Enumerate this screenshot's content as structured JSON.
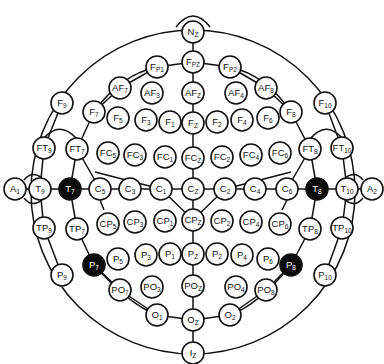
{
  "diagram": {
    "colors": {
      "line": "#111111",
      "fill": "#ffffff",
      "highlight": "#0a0a0a",
      "highlight_text": "#ffffff"
    },
    "radius": 11,
    "electrodes": [
      {
        "id": "Nz",
        "base": "N",
        "sub": "Z",
        "x": 193,
        "y": 32
      },
      {
        "id": "Fpz",
        "base": "F",
        "sub": "PZ",
        "x": 193,
        "y": 62
      },
      {
        "id": "Fp1",
        "base": "F",
        "sub": "P1",
        "x": 157,
        "y": 67
      },
      {
        "id": "Fp2",
        "base": "F",
        "sub": "P2",
        "x": 230,
        "y": 67
      },
      {
        "id": "AF7",
        "base": "AF",
        "sub": "7",
        "x": 120,
        "y": 88
      },
      {
        "id": "AF3",
        "base": "AF",
        "sub": "3",
        "x": 152,
        "y": 93
      },
      {
        "id": "AFz",
        "base": "AF",
        "sub": "Z",
        "x": 193,
        "y": 93
      },
      {
        "id": "AF4",
        "base": "AF",
        "sub": "4",
        "x": 236,
        "y": 93
      },
      {
        "id": "AF8",
        "base": "AF",
        "sub": "8",
        "x": 266,
        "y": 88
      },
      {
        "id": "F9",
        "base": "F",
        "sub": "9",
        "x": 62,
        "y": 103
      },
      {
        "id": "F7",
        "base": "F",
        "sub": "7",
        "x": 94,
        "y": 112
      },
      {
        "id": "F5",
        "base": "F",
        "sub": "5",
        "x": 118,
        "y": 118
      },
      {
        "id": "F3",
        "base": "F",
        "sub": "3",
        "x": 146,
        "y": 120
      },
      {
        "id": "F1",
        "base": "F",
        "sub": "1",
        "x": 170,
        "y": 122
      },
      {
        "id": "Fz",
        "base": "F",
        "sub": "Z",
        "x": 193,
        "y": 123
      },
      {
        "id": "F2",
        "base": "F",
        "sub": "2",
        "x": 217,
        "y": 122
      },
      {
        "id": "F4",
        "base": "F",
        "sub": "4",
        "x": 242,
        "y": 120
      },
      {
        "id": "F6",
        "base": "F",
        "sub": "6",
        "x": 268,
        "y": 118
      },
      {
        "id": "F8",
        "base": "F",
        "sub": "8",
        "x": 291,
        "y": 112
      },
      {
        "id": "F10",
        "base": "F",
        "sub": "10",
        "x": 325,
        "y": 103
      },
      {
        "id": "FT9",
        "base": "FT",
        "sub": "9",
        "x": 44,
        "y": 148
      },
      {
        "id": "FT7",
        "base": "FT",
        "sub": "7",
        "x": 77,
        "y": 149
      },
      {
        "id": "FC5",
        "base": "FC",
        "sub": "5",
        "x": 108,
        "y": 153
      },
      {
        "id": "FC3",
        "base": "FC",
        "sub": "3",
        "x": 135,
        "y": 155
      },
      {
        "id": "FC1",
        "base": "FC",
        "sub": "1",
        "x": 165,
        "y": 157
      },
      {
        "id": "FCz",
        "base": "FC",
        "sub": "Z",
        "x": 193,
        "y": 158
      },
      {
        "id": "FC2",
        "base": "FC",
        "sub": "2",
        "x": 222,
        "y": 157
      },
      {
        "id": "FC4",
        "base": "FC",
        "sub": "4",
        "x": 251,
        "y": 155
      },
      {
        "id": "FC6",
        "base": "FC",
        "sub": "6",
        "x": 280,
        "y": 153
      },
      {
        "id": "FT8",
        "base": "FT",
        "sub": "8",
        "x": 310,
        "y": 149
      },
      {
        "id": "FT10",
        "base": "FT",
        "sub": "10",
        "x": 342,
        "y": 148
      },
      {
        "id": "A1",
        "base": "A",
        "sub": "1",
        "x": 15,
        "y": 189
      },
      {
        "id": "T9",
        "base": "T",
        "sub": "9",
        "x": 40,
        "y": 189
      },
      {
        "id": "T7",
        "base": "T",
        "sub": "7",
        "x": 70,
        "y": 189,
        "dark": true
      },
      {
        "id": "C5",
        "base": "C",
        "sub": "5",
        "x": 100,
        "y": 189
      },
      {
        "id": "C3",
        "base": "C",
        "sub": "3",
        "x": 130,
        "y": 189
      },
      {
        "id": "C1",
        "base": "C",
        "sub": "1",
        "x": 161,
        "y": 189
      },
      {
        "id": "Cz",
        "base": "C",
        "sub": "Z",
        "x": 193,
        "y": 189
      },
      {
        "id": "C2",
        "base": "C",
        "sub": "2",
        "x": 225,
        "y": 189
      },
      {
        "id": "C4",
        "base": "C",
        "sub": "4",
        "x": 255,
        "y": 189
      },
      {
        "id": "C6",
        "base": "C",
        "sub": "6",
        "x": 287,
        "y": 189
      },
      {
        "id": "T8",
        "base": "T",
        "sub": "8",
        "x": 317,
        "y": 189,
        "dark": true
      },
      {
        "id": "T10",
        "base": "T",
        "sub": "10",
        "x": 347,
        "y": 189
      },
      {
        "id": "A2",
        "base": "A",
        "sub": "2",
        "x": 372,
        "y": 189
      },
      {
        "id": "TP9",
        "base": "TP",
        "sub": "9",
        "x": 44,
        "y": 228
      },
      {
        "id": "TP7",
        "base": "TP",
        "sub": "7",
        "x": 77,
        "y": 229
      },
      {
        "id": "CP5",
        "base": "CP",
        "sub": "5",
        "x": 108,
        "y": 224
      },
      {
        "id": "CP3",
        "base": "CP",
        "sub": "3",
        "x": 135,
        "y": 222
      },
      {
        "id": "CP1",
        "base": "CP",
        "sub": "1",
        "x": 165,
        "y": 221
      },
      {
        "id": "CPz",
        "base": "CP",
        "sub": "Z",
        "x": 193,
        "y": 220
      },
      {
        "id": "CP2",
        "base": "CP",
        "sub": "2",
        "x": 222,
        "y": 221
      },
      {
        "id": "CP4",
        "base": "CP",
        "sub": "4",
        "x": 251,
        "y": 222
      },
      {
        "id": "CP6",
        "base": "CP",
        "sub": "6",
        "x": 280,
        "y": 224
      },
      {
        "id": "TP8",
        "base": "TP",
        "sub": "8",
        "x": 310,
        "y": 229
      },
      {
        "id": "TP10",
        "base": "TP",
        "sub": "10",
        "x": 342,
        "y": 228
      },
      {
        "id": "P9",
        "base": "P",
        "sub": "9",
        "x": 62,
        "y": 275
      },
      {
        "id": "P7",
        "base": "P",
        "sub": "7",
        "x": 94,
        "y": 265,
        "dark": true
      },
      {
        "id": "P5",
        "base": "P",
        "sub": "5",
        "x": 118,
        "y": 259
      },
      {
        "id": "P3",
        "base": "P",
        "sub": "3",
        "x": 146,
        "y": 255
      },
      {
        "id": "P1",
        "base": "P",
        "sub": "1",
        "x": 170,
        "y": 254
      },
      {
        "id": "Pz",
        "base": "P",
        "sub": "Z",
        "x": 193,
        "y": 254
      },
      {
        "id": "P2",
        "base": "P",
        "sub": "2",
        "x": 217,
        "y": 254
      },
      {
        "id": "P4",
        "base": "P",
        "sub": "4",
        "x": 242,
        "y": 255
      },
      {
        "id": "P6",
        "base": "P",
        "sub": "6",
        "x": 268,
        "y": 259
      },
      {
        "id": "P8",
        "base": "P",
        "sub": "8",
        "x": 291,
        "y": 265,
        "dark": true
      },
      {
        "id": "P10",
        "base": "P",
        "sub": "10",
        "x": 325,
        "y": 275
      },
      {
        "id": "PO7",
        "base": "PO",
        "sub": "7",
        "x": 120,
        "y": 290
      },
      {
        "id": "PO3",
        "base": "PO",
        "sub": "3",
        "x": 152,
        "y": 287
      },
      {
        "id": "POz",
        "base": "PO",
        "sub": "Z",
        "x": 193,
        "y": 286
      },
      {
        "id": "PO4",
        "base": "PO",
        "sub": "4",
        "x": 236,
        "y": 287
      },
      {
        "id": "PO8",
        "base": "PO",
        "sub": "8",
        "x": 266,
        "y": 290
      },
      {
        "id": "O1",
        "base": "O",
        "sub": "1",
        "x": 157,
        "y": 315
      },
      {
        "id": "Oz",
        "base": "O",
        "sub": "Z",
        "x": 193,
        "y": 320
      },
      {
        "id": "O2",
        "base": "O",
        "sub": "2",
        "x": 230,
        "y": 315
      },
      {
        "id": "Iz",
        "base": "I",
        "sub": "Z",
        "x": 193,
        "y": 353
      }
    ],
    "connections": [
      [
        "Nz",
        "Fpz"
      ],
      [
        "Fpz",
        "AFz"
      ],
      [
        "AFz",
        "Fz"
      ],
      [
        "Fz",
        "FCz"
      ],
      [
        "FCz",
        "Cz"
      ],
      [
        "Cz",
        "CPz"
      ],
      [
        "CPz",
        "Pz"
      ],
      [
        "Pz",
        "POz"
      ],
      [
        "POz",
        "Oz"
      ],
      [
        "Oz",
        "Iz"
      ],
      [
        "Fpz",
        "Fp1"
      ],
      [
        "Fpz",
        "Fp2"
      ],
      [
        "Fp1",
        "AF7"
      ],
      [
        "AF7",
        "F7"
      ],
      [
        "F7",
        "FT7"
      ],
      [
        "FT7",
        "T7"
      ],
      [
        "T7",
        "TP7"
      ],
      [
        "TP7",
        "P7"
      ],
      [
        "P7",
        "PO7"
      ],
      [
        "PO7",
        "O1"
      ],
      [
        "O1",
        "Oz"
      ],
      [
        "Fp2",
        "AF8"
      ],
      [
        "AF8",
        "F8"
      ],
      [
        "F8",
        "FT8"
      ],
      [
        "FT8",
        "T8"
      ],
      [
        "T8",
        "TP8"
      ],
      [
        "TP8",
        "P8"
      ],
      [
        "P8",
        "PO8"
      ],
      [
        "PO8",
        "O2"
      ],
      [
        "O2",
        "Oz"
      ],
      [
        "F9",
        "FT9"
      ],
      [
        "FT9",
        "T9"
      ],
      [
        "T9",
        "TP9"
      ],
      [
        "TP9",
        "P9"
      ],
      [
        "F10",
        "FT10"
      ],
      [
        "FT10",
        "T10"
      ],
      [
        "T10",
        "TP10"
      ],
      [
        "TP10",
        "P10"
      ],
      [
        "A1",
        "T9"
      ],
      [
        "T9",
        "T7"
      ],
      [
        "T7",
        "C5"
      ],
      [
        "C5",
        "C3"
      ],
      [
        "C3",
        "C1"
      ],
      [
        "C1",
        "Cz"
      ],
      [
        "Cz",
        "C2"
      ],
      [
        "C2",
        "C4"
      ],
      [
        "C4",
        "C6"
      ],
      [
        "C6",
        "T8"
      ],
      [
        "T8",
        "T10"
      ],
      [
        "T10",
        "A2"
      ],
      [
        "FT7",
        "C5"
      ],
      [
        "FT8",
        "C6"
      ]
    ]
  }
}
